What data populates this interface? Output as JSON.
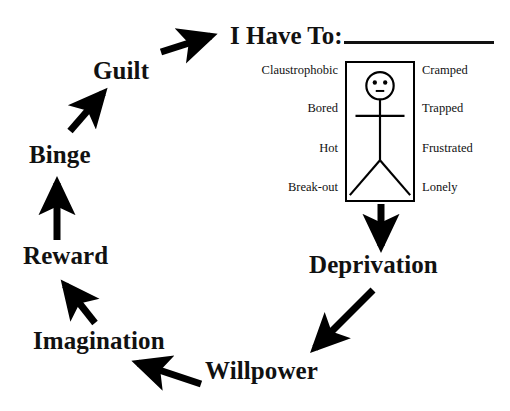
{
  "diagram": {
    "title_visible": false,
    "cycle_nodes": [
      {
        "id": "guilt",
        "label": "Guilt"
      },
      {
        "id": "binge",
        "label": "Binge"
      },
      {
        "id": "reward",
        "label": "Reward"
      },
      {
        "id": "imagination",
        "label": "Imagination"
      },
      {
        "id": "willpower",
        "label": "Willpower"
      },
      {
        "id": "deprivation",
        "label": "Deprivation"
      }
    ],
    "arrows": [
      {
        "from": "reward",
        "to": "binge",
        "direction": "up"
      },
      {
        "from": "binge",
        "to": "guilt",
        "direction": "up-right"
      },
      {
        "from": "guilt",
        "to": "heading",
        "direction": "up-right"
      },
      {
        "from": "box",
        "to": "deprivation",
        "direction": "down"
      },
      {
        "from": "deprivation",
        "to": "willpower",
        "direction": "down-left"
      },
      {
        "from": "willpower",
        "to": "imagination",
        "direction": "left"
      },
      {
        "from": "imagination",
        "to": "reward",
        "direction": "up-left"
      }
    ],
    "colors": {
      "ink": "#000000",
      "background": "#ffffff"
    }
  },
  "heading": {
    "prompt": "I Have To:",
    "blank_label": "fill-in-the-blank line"
  },
  "box": {
    "figure": "stick-figure",
    "left_labels": [
      "Claustrophobic",
      "Bored",
      "Hot",
      "Break-out"
    ],
    "right_labels": [
      "Cramped",
      "Trapped",
      "Frustrated",
      "Lonely"
    ]
  }
}
